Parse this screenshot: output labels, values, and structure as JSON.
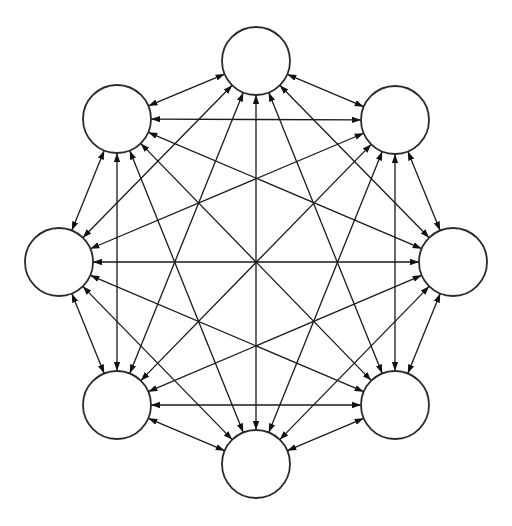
{
  "diagram": {
    "type": "complete-graph",
    "directed": "bidirectional",
    "node_radius": 34,
    "colors": {
      "background": "#ffffff",
      "stroke": "#1a1a1a",
      "node_fill": "#ffffff"
    },
    "nodes": [
      {
        "id": "n-top",
        "cx": 256,
        "cy": 61
      },
      {
        "id": "n-top-right",
        "cx": 395,
        "cy": 120
      },
      {
        "id": "n-right",
        "cx": 453,
        "cy": 262
      },
      {
        "id": "n-bottom-right",
        "cx": 395,
        "cy": 405
      },
      {
        "id": "n-bottom",
        "cx": 256,
        "cy": 464
      },
      {
        "id": "n-bottom-left",
        "cx": 117,
        "cy": 405
      },
      {
        "id": "n-left",
        "cx": 59,
        "cy": 262
      },
      {
        "id": "n-top-left",
        "cx": 117,
        "cy": 119
      }
    ],
    "edges": "all-pairs"
  }
}
